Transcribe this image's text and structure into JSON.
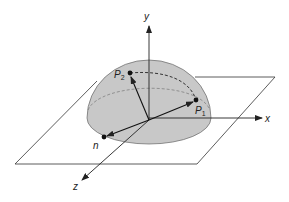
{
  "diagram": {
    "axes": {
      "x_label": "x",
      "y_label": "y",
      "z_label": "z"
    },
    "points": {
      "p1_main": "P",
      "p1_sub": "1",
      "p2_main": "P",
      "p2_sub": "2",
      "n_label": "n"
    },
    "colors": {
      "hemisphere_fill": "#c8c8c8",
      "line": "#222222",
      "dashed": "#555555",
      "background": "#ffffff"
    }
  }
}
